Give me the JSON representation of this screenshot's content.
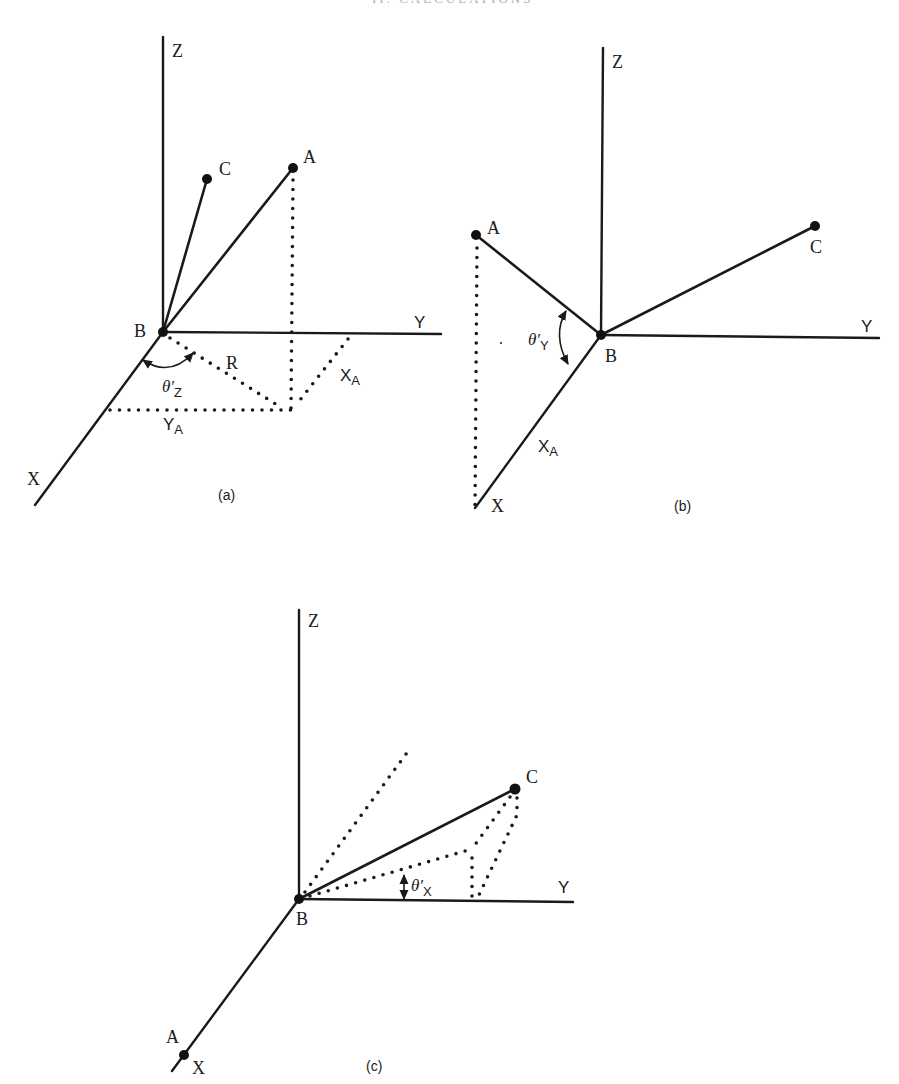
{
  "page": {
    "header_fragment": "II. CALCULATIONS",
    "background": "#ffffff",
    "ink_color": "#1a1a1a"
  },
  "panels": [
    {
      "id": "a",
      "caption": "(a)",
      "axes": {
        "z": "Z",
        "y": "Y",
        "x": "X"
      },
      "points": {
        "a": "A",
        "b": "B",
        "c": "C"
      },
      "labels": {
        "r": "R",
        "xa_main": "X",
        "xa_sub": "A",
        "ya_main": "Y",
        "ya_sub": "A",
        "theta": "θ′",
        "theta_sub": "Z"
      },
      "description": "Projection of vector BA onto XY plane with radius R, components X_A and Y_A, and angle θ′Z measured from X axis"
    },
    {
      "id": "b",
      "caption": "(b)",
      "axes": {
        "z": "Z",
        "y": "Y",
        "x": "X"
      },
      "points": {
        "a": "A",
        "b": "B",
        "c": "C"
      },
      "labels": {
        "xa_main": "X",
        "xa_sub": "A",
        "theta": "θ′",
        "theta_sub": "Y"
      },
      "description": "After rotation about Z: A lies in XZ plane, angle θ′Y between BA and X axis"
    },
    {
      "id": "c",
      "caption": "(c)",
      "axes": {
        "z": "Z",
        "y": "Y",
        "x": "X"
      },
      "points": {
        "a": "A",
        "b": "B",
        "c": "C"
      },
      "labels": {
        "theta": "θ′",
        "theta_sub": "X"
      },
      "description": "After rotation about Y: A lies on X axis, angle θ′X of projection of BC measured from Y axis"
    }
  ]
}
